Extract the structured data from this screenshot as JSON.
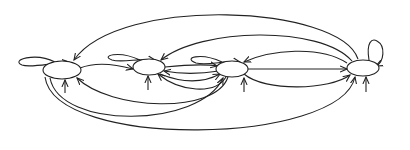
{
  "diagram": {
    "type": "state-transition-graph",
    "caption": "",
    "colors": {
      "stroke": "#222222",
      "background": "#ffffff",
      "node_fill": "#ffffff"
    },
    "nodes": [
      {
        "id": "n1",
        "label": "",
        "cx": 62,
        "cy": 70,
        "rx": 19,
        "ry": 9,
        "has_self_loop": true,
        "has_input_arrow": true
      },
      {
        "id": "n2",
        "label": "",
        "cx": 149,
        "cy": 67,
        "rx": 16,
        "ry": 8,
        "has_self_loop": true,
        "has_input_arrow": true
      },
      {
        "id": "n3",
        "label": "",
        "cx": 232,
        "cy": 69,
        "rx": 16,
        "ry": 8,
        "has_self_loop": true,
        "has_input_arrow": true
      },
      {
        "id": "n4",
        "label": "",
        "cx": 363,
        "cy": 68,
        "rx": 16,
        "ry": 8,
        "has_self_loop": true,
        "has_input_arrow": true
      }
    ],
    "edges": [
      {
        "from": "n4",
        "to": "n1",
        "route": "top-outer"
      },
      {
        "from": "n4",
        "to": "n2",
        "route": "top-middle"
      },
      {
        "from": "n4",
        "to": "n3",
        "route": "top-inner"
      },
      {
        "from": "n1",
        "to": "n2",
        "route": "direct"
      },
      {
        "from": "n3",
        "to": "n2",
        "route": "direct-lower"
      },
      {
        "from": "n3",
        "to": "n2",
        "route": "lower-arc"
      },
      {
        "from": "n2",
        "to": "n3",
        "route": "direct"
      },
      {
        "from": "n2",
        "to": "n3",
        "route": "lower"
      },
      {
        "from": "n3",
        "to": "n4",
        "route": "direct"
      },
      {
        "from": "n3",
        "to": "n4",
        "route": "bottom-arc"
      },
      {
        "from": "n3",
        "to": "n1",
        "route": "bottom-arc"
      },
      {
        "from": "n1",
        "to": "n3",
        "route": "bottom-wide"
      },
      {
        "from": "n1",
        "to": "n4",
        "route": "bottom-widest"
      }
    ]
  }
}
